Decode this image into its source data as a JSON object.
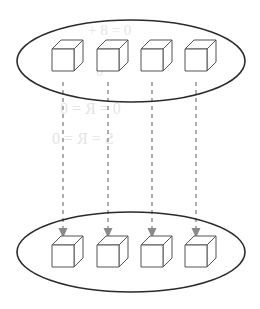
{
  "figure": {
    "width": 260,
    "height": 309,
    "background_color": "#ffffff",
    "stroke_color": "#2b2b2b",
    "cube_line_color": "#555555",
    "cube_face_color": "#ffffff",
    "arrow_color": "#8a8a8a",
    "bleed_color": "#cfcfcf"
  },
  "sets": [
    {
      "name": "top-set",
      "label": "",
      "cx": 131,
      "cy": 61,
      "rx": 114,
      "ry": 41,
      "items": [
        {
          "name": "cube-1",
          "x": 63,
          "y": 60
        },
        {
          "name": "cube-2",
          "x": 108,
          "y": 60
        },
        {
          "name": "cube-3",
          "x": 152,
          "y": 60
        },
        {
          "name": "cube-4",
          "x": 196,
          "y": 60
        }
      ]
    },
    {
      "name": "bottom-set",
      "label": "",
      "cx": 131,
      "cy": 252,
      "rx": 114,
      "ry": 40,
      "items": [
        {
          "name": "cube-1",
          "x": 63,
          "y": 256
        },
        {
          "name": "cube-2",
          "x": 108,
          "y": 256
        },
        {
          "name": "cube-3",
          "x": 152,
          "y": 256
        },
        {
          "name": "cube-4",
          "x": 196,
          "y": 256
        }
      ]
    }
  ],
  "cube": {
    "front_size": 22,
    "depth_x": 9,
    "depth_y": 9
  },
  "arrows": [
    {
      "name": "arrow-1",
      "x": 63,
      "y_start": 82,
      "y_end": 238
    },
    {
      "name": "arrow-2",
      "x": 108,
      "y_start": 82,
      "y_end": 238
    },
    {
      "name": "arrow-3",
      "x": 152,
      "y_start": 82,
      "y_end": 238
    },
    {
      "name": "arrow-4",
      "x": 196,
      "y_start": 82,
      "y_end": 238
    }
  ],
  "arrow_style": {
    "dash_on": 4,
    "dash_off": 4,
    "stroke_width": 1.4,
    "head_width": 9,
    "head_length": 10
  },
  "bleed_through": [
    {
      "name": "bleed-line-1",
      "text": "0 = 8 +",
      "x": 88,
      "y": 22,
      "size": 15
    },
    {
      "name": "bleed-line-2",
      "text": "0",
      "x": 96,
      "y": 64,
      "size": 14
    },
    {
      "name": "bleed-line-3",
      "text": "0 = R = 0",
      "x": 60,
      "y": 100,
      "size": 16
    },
    {
      "name": "bleed-line-4",
      "text": "S = R = 0",
      "x": 52,
      "y": 130,
      "size": 16
    }
  ]
}
